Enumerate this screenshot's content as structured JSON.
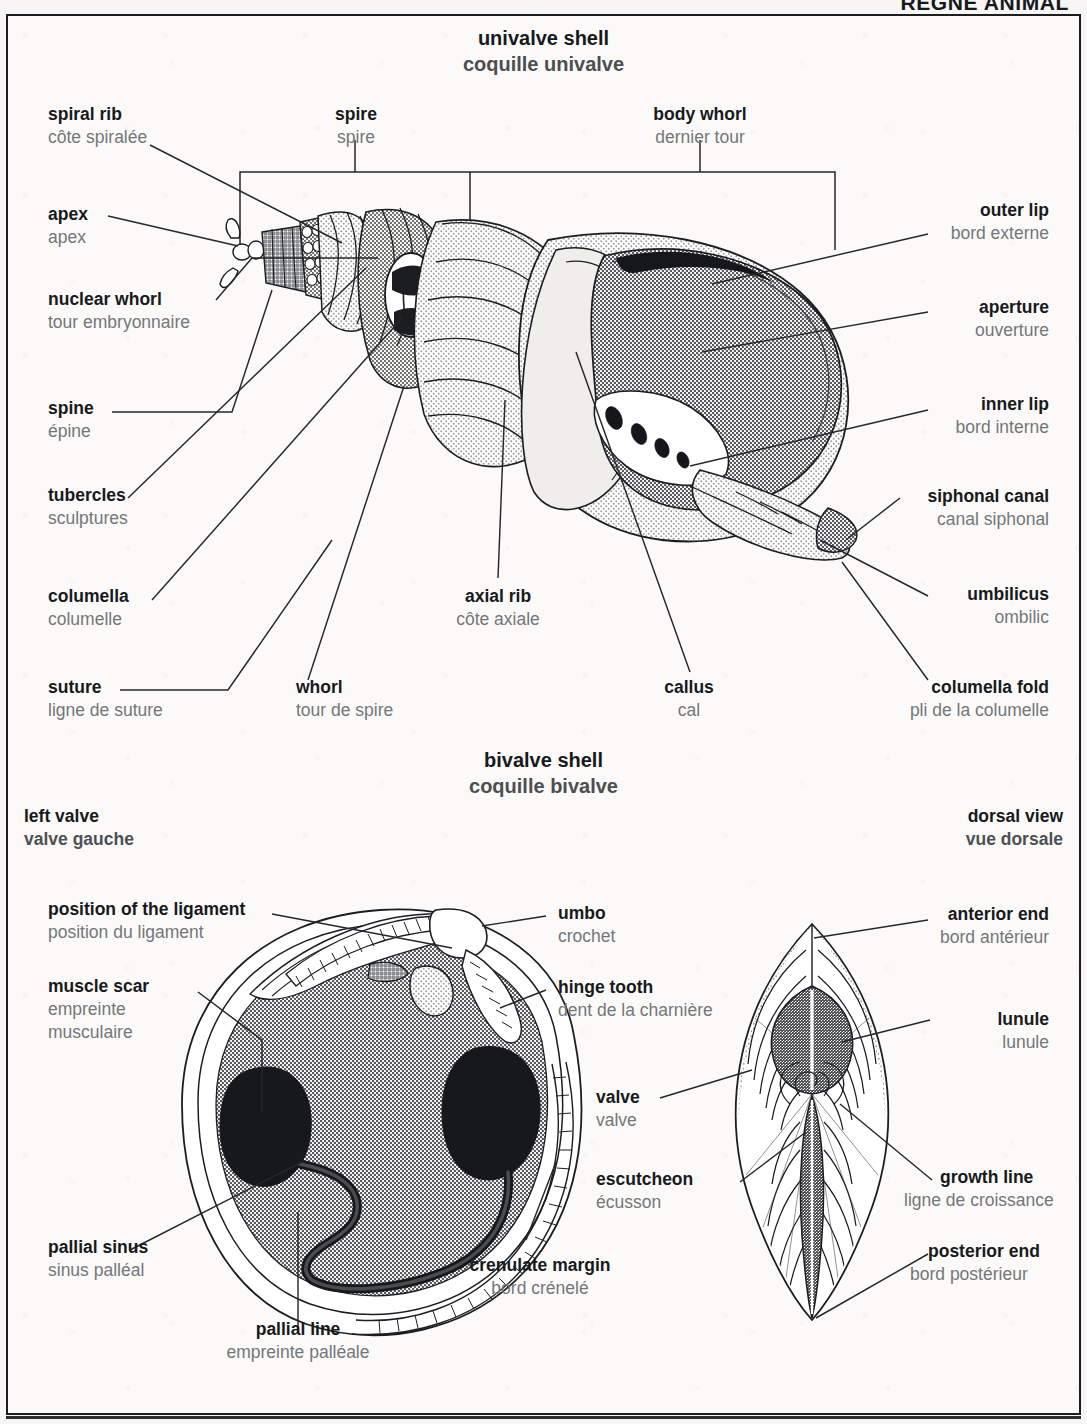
{
  "running_head": "RÈGNE ANIMAL",
  "sections": [
    {
      "id": "univalve",
      "title_en": "univalve shell",
      "title_fr": "coquille univalve"
    },
    {
      "id": "bivalve",
      "title_en": "bivalve shell",
      "title_fr": "coquille bivalve"
    }
  ],
  "view_labels": [
    {
      "id": "left-valve",
      "en": "left valve",
      "fr": "valve gauche"
    },
    {
      "id": "dorsal-view",
      "en": "dorsal view",
      "fr": "vue dorsale"
    }
  ],
  "univalve_labels": [
    {
      "id": "spiral-rib",
      "en": "spiral rib",
      "fr": "côte spiralée"
    },
    {
      "id": "spire",
      "en": "spire",
      "fr": "spire"
    },
    {
      "id": "body-whorl",
      "en": "body whorl",
      "fr": "dernier tour"
    },
    {
      "id": "apex",
      "en": "apex",
      "fr": "apex"
    },
    {
      "id": "nuclear-whorl",
      "en": "nuclear whorl",
      "fr": "tour embryonnaire"
    },
    {
      "id": "spine",
      "en": "spine",
      "fr": "épine"
    },
    {
      "id": "tubercles",
      "en": "tubercles",
      "fr": "sculptures"
    },
    {
      "id": "columella",
      "en": "columella",
      "fr": "columelle"
    },
    {
      "id": "suture",
      "en": "suture",
      "fr": "ligne de suture"
    },
    {
      "id": "whorl",
      "en": "whorl",
      "fr": "tour de spire"
    },
    {
      "id": "axial-rib",
      "en": "axial rib",
      "fr": "côte axiale"
    },
    {
      "id": "callus",
      "en": "callus",
      "fr": "cal"
    },
    {
      "id": "outer-lip",
      "en": "outer lip",
      "fr": "bord externe"
    },
    {
      "id": "aperture",
      "en": "aperture",
      "fr": "ouverture"
    },
    {
      "id": "inner-lip",
      "en": "inner lip",
      "fr": "bord interne"
    },
    {
      "id": "siphonal-canal",
      "en": "siphonal canal",
      "fr": "canal siphonal"
    },
    {
      "id": "umbilicus",
      "en": "umbilicus",
      "fr": "ombilic"
    },
    {
      "id": "columella-fold",
      "en": "columella fold",
      "fr": "pli de la columelle"
    }
  ],
  "bivalve_labels": [
    {
      "id": "position-of-the-ligament",
      "en": "position of the ligament",
      "fr": "position du ligament"
    },
    {
      "id": "muscle-scar",
      "en": "muscle scar",
      "fr": "empreinte\nmusculaire"
    },
    {
      "id": "pallial-sinus",
      "en": "pallial sinus",
      "fr": "sinus palléal"
    },
    {
      "id": "pallial-line",
      "en": "pallial line",
      "fr": "empreinte palléale"
    },
    {
      "id": "crenulate-margin",
      "en": "crenulate margin",
      "fr": "bord crénelé"
    },
    {
      "id": "umbo",
      "en": "umbo",
      "fr": "crochet"
    },
    {
      "id": "hinge-tooth",
      "en": "hinge tooth",
      "fr": "dent de la charnière"
    },
    {
      "id": "anterior-end",
      "en": "anterior end",
      "fr": "bord antérieur"
    },
    {
      "id": "lunule",
      "en": "lunule",
      "fr": "lunule"
    },
    {
      "id": "valve",
      "en": "valve",
      "fr": "valve"
    },
    {
      "id": "growth-line",
      "en": "growth line",
      "fr": "ligne de croissance"
    },
    {
      "id": "escutcheon",
      "en": "escutcheon",
      "fr": "écusson"
    },
    {
      "id": "posterior-end",
      "en": "posterior end",
      "fr": "bord postérieur"
    }
  ],
  "colors": {
    "ink": "#17191d",
    "french": "#74767a",
    "leader": "#25272b",
    "shell_light": "#e6e4e0",
    "shell_mid": "#b9b7b3",
    "shell_dark": "#8d8b88",
    "shell_black": "#16181b",
    "paper": "#fbfaf8"
  }
}
